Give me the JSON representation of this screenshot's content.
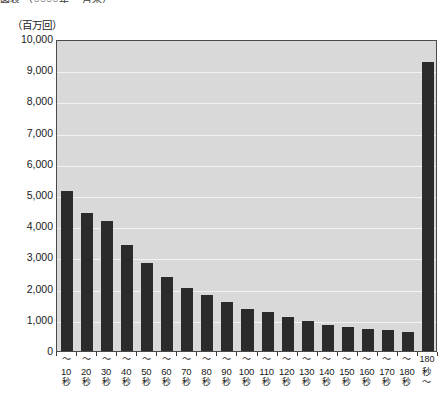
{
  "title_cut": "図表  （○○○○年  ・月末）",
  "axis": {
    "unit_label": "（百万回）",
    "y_ticks": [
      "10,000",
      "9,000",
      "8,000",
      "7,000",
      "6,000",
      "5,000",
      "4,000",
      "3,000",
      "2,000",
      "1,000",
      "0"
    ]
  },
  "chart_data": {
    "type": "bar",
    "title": "",
    "subtitle": "",
    "xlabel": "",
    "ylabel": "（百万回）",
    "ylim": [
      0,
      10000
    ],
    "ytick_step": 1000,
    "grid": true,
    "legend": "none",
    "bar_color": "#2b2b2b",
    "plot_background": "#d9d9d9",
    "categories": [
      "〜10秒",
      "〜20秒",
      "〜30秒",
      "〜40秒",
      "〜50秒",
      "〜60秒",
      "〜70秒",
      "〜80秒",
      "〜90秒",
      "〜100秒",
      "〜110秒",
      "〜120秒",
      "〜130秒",
      "〜140秒",
      "〜150秒",
      "〜160秒",
      "〜170秒",
      "〜180秒",
      "180秒〜"
    ],
    "category_parts": [
      {
        "top": "〜",
        "num": "10",
        "bottom": "秒"
      },
      {
        "top": "〜",
        "num": "20",
        "bottom": "秒"
      },
      {
        "top": "〜",
        "num": "30",
        "bottom": "秒"
      },
      {
        "top": "〜",
        "num": "40",
        "bottom": "秒"
      },
      {
        "top": "〜",
        "num": "50",
        "bottom": "秒"
      },
      {
        "top": "〜",
        "num": "60",
        "bottom": "秒"
      },
      {
        "top": "〜",
        "num": "70",
        "bottom": "秒"
      },
      {
        "top": "〜",
        "num": "80",
        "bottom": "秒"
      },
      {
        "top": "〜",
        "num": "90",
        "bottom": "秒"
      },
      {
        "top": "〜",
        "num": "100",
        "bottom": "秒"
      },
      {
        "top": "〜",
        "num": "110",
        "bottom": "秒"
      },
      {
        "top": "〜",
        "num": "120",
        "bottom": "秒"
      },
      {
        "top": "〜",
        "num": "130",
        "bottom": "秒"
      },
      {
        "top": "〜",
        "num": "140",
        "bottom": "秒"
      },
      {
        "top": "〜",
        "num": "150",
        "bottom": "秒"
      },
      {
        "top": "〜",
        "num": "160",
        "bottom": "秒"
      },
      {
        "top": "〜",
        "num": "170",
        "bottom": "秒"
      },
      {
        "top": "〜",
        "num": "180",
        "bottom": "秒"
      },
      {
        "top": "180",
        "num": "秒",
        "bottom": "〜"
      }
    ],
    "values": [
      5130,
      4420,
      4180,
      3400,
      2820,
      2370,
      2020,
      1780,
      1560,
      1350,
      1250,
      1100,
      950,
      840,
      760,
      700,
      660,
      610,
      9260
    ]
  }
}
